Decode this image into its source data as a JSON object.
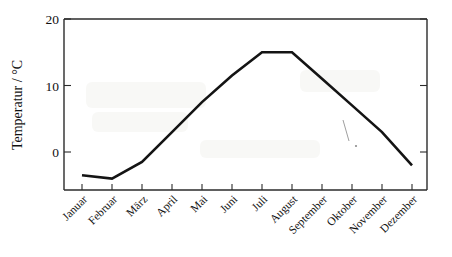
{
  "chart_data": {
    "type": "line",
    "title": "",
    "xlabel": "",
    "ylabel": "Temperatur / °C",
    "categories": [
      "Januar",
      "Februar",
      "März",
      "April",
      "Mai",
      "Juni",
      "Juli",
      "August",
      "September",
      "Oktober",
      "November",
      "Dezember"
    ],
    "values": [
      -3.5,
      -4,
      -1.5,
      3,
      7.5,
      11.5,
      15,
      15,
      11,
      7,
      3,
      -2
    ],
    "series": [
      {
        "name": "Temperatur",
        "values": [
          -3.5,
          -4,
          -1.5,
          3,
          7.5,
          11.5,
          15,
          15,
          11,
          7,
          3,
          -2
        ]
      }
    ],
    "ylim": [
      -5,
      20
    ],
    "yticks": [
      0,
      10,
      20
    ],
    "ytick_labels": [
      "0",
      "10",
      "20"
    ],
    "grid": false,
    "legend": "none",
    "line_color": "#141414",
    "axis_color": "#2b2b2b"
  },
  "axis": {
    "y_label": "Temperatur / °C",
    "y_ticks": [
      {
        "label": "20",
        "value": 20
      },
      {
        "label": "10",
        "value": 10
      },
      {
        "label": "0",
        "value": 0
      }
    ],
    "x_ticks": [
      {
        "label": "Januar"
      },
      {
        "label": "Februar"
      },
      {
        "label": "März"
      },
      {
        "label": "April"
      },
      {
        "label": "Mai"
      },
      {
        "label": "Juni"
      },
      {
        "label": "Juli"
      },
      {
        "label": "August"
      },
      {
        "label": "September"
      },
      {
        "label": "Oktober"
      },
      {
        "label": "November"
      },
      {
        "label": "Dezember"
      }
    ]
  }
}
